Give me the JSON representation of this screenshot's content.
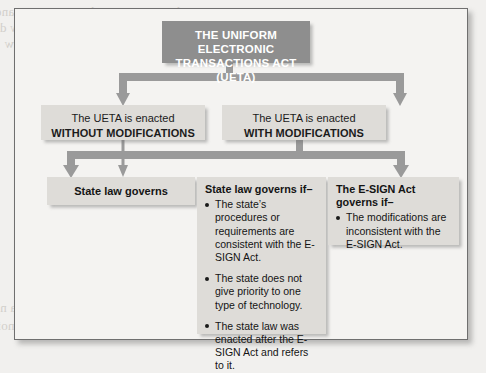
{
  "page": {
    "background_color": "#f1f0ee",
    "frame_color": "#6f6f6f",
    "figure_background": "#f4f3f1"
  },
  "colors": {
    "header_box": "#8e8e8e",
    "header_text": "#ffffff",
    "box_fill": "#dedcd8",
    "box_text": "#141414",
    "connector": "#9a9a9a"
  },
  "flowchart": {
    "type": "diagram",
    "title_box": {
      "line1": "THE UNIFORM ELECTRONIC",
      "line2": "TRANSACTIONS ACT (UETA)"
    },
    "branches": [
      {
        "lead": "The UETA is enacted",
        "emphasis": "WITHOUT MODIFICATIONS"
      },
      {
        "lead": "The UETA is enacted",
        "emphasis": "WITH MODIFICATIONS"
      }
    ],
    "outcomes": [
      {
        "kind": "result",
        "label": "State law governs"
      },
      {
        "kind": "list",
        "heading": "State law governs if–",
        "items": [
          "The state’s procedures or requirements are consistent with the E-SIGN Act.",
          "The state does not give priority to one type of technology.",
          "The state law was enacted after the E-SIGN Act and refers to it."
        ]
      },
      {
        "kind": "list",
        "heading": "The E-SIGN Act governs if–",
        "items": [
          "The modifications are inconsistent with the E-SIGN Act."
        ]
      }
    ]
  },
  "bleed_through": {
    "lines": [
      "ni noitcasnart cinortcele",
      "detcane si ATEU eht erehw",
      "eht htiw tnetsisnoc era",
      "ton seod etats eht dna",
      "ygolonhcet fo epyt eno",
      "tca ngis-e eht fo snoisivorp",
      "yam etats a ,revewoh",
      "ot sdrager ni yfidom",
      "serudecorp sti gnitcane",
      "wal etats eht nehw dna",
      "eht retfa detcane saw",
      "ti ot srefer dna tca ngis-e"
    ]
  }
}
